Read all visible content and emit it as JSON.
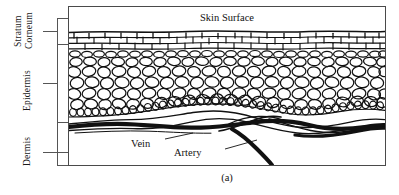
{
  "figure": {
    "caption": "(a)",
    "surface_label": "Skin Surface",
    "layers": [
      {
        "id": "stratum-corneum",
        "word1": "Stratum",
        "word2": "Corneum"
      },
      {
        "id": "epidermis",
        "label": "Epidermis"
      },
      {
        "id": "dermis",
        "label": "Dermis"
      }
    ],
    "vessels": [
      {
        "id": "vein",
        "label": "Vein"
      },
      {
        "id": "artery",
        "label": "Artery"
      }
    ],
    "colors": {
      "ink": "#111111",
      "frame": "#4a4a4a",
      "bracket": "#555555",
      "background": "#ffffff"
    }
  }
}
